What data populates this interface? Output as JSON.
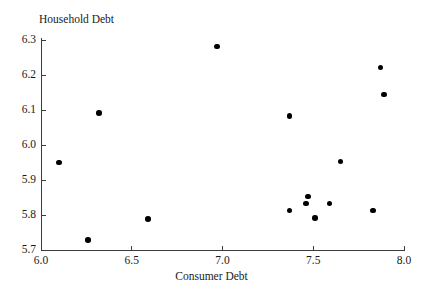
{
  "chart_data": {
    "type": "scatter",
    "title": "",
    "xlabel": "Consumer Debt",
    "ylabel": "Household Debt",
    "xlim": [
      6.0,
      8.0
    ],
    "ylim": [
      5.7,
      6.3
    ],
    "xticks": [
      "6.0",
      "6.5",
      "7.0",
      "7.5",
      "8.0"
    ],
    "yticks": [
      "5.7",
      "5.8",
      "5.9",
      "6.0",
      "6.1",
      "6.2",
      "6.3"
    ],
    "xtick_values": [
      6.0,
      6.5,
      7.0,
      7.5,
      8.0
    ],
    "ytick_values": [
      5.7,
      5.8,
      5.9,
      6.0,
      6.1,
      6.2,
      6.3
    ],
    "grid": false,
    "legend": false,
    "marker": "filled-circle",
    "marker_color": "#000000",
    "n_points": 15,
    "points": [
      {
        "x": 6.1,
        "y": 5.95
      },
      {
        "x": 6.26,
        "y": 5.729
      },
      {
        "x": 6.32,
        "y": 6.092
      },
      {
        "x": 6.59,
        "y": 5.789
      },
      {
        "x": 6.97,
        "y": 6.281
      },
      {
        "x": 7.37,
        "y": 6.083
      },
      {
        "x": 7.37,
        "y": 5.813
      },
      {
        "x": 7.47,
        "y": 5.853
      },
      {
        "x": 7.46,
        "y": 5.833
      },
      {
        "x": 7.51,
        "y": 5.792
      },
      {
        "x": 7.59,
        "y": 5.833
      },
      {
        "x": 7.65,
        "y": 5.953
      },
      {
        "x": 7.83,
        "y": 5.813
      },
      {
        "x": 7.87,
        "y": 6.221
      },
      {
        "x": 7.89,
        "y": 6.144
      }
    ]
  },
  "colors": {
    "axis": "#3c3c3c",
    "text": "#1a1a1a",
    "marker": "#000000",
    "background": "#ffffff"
  }
}
